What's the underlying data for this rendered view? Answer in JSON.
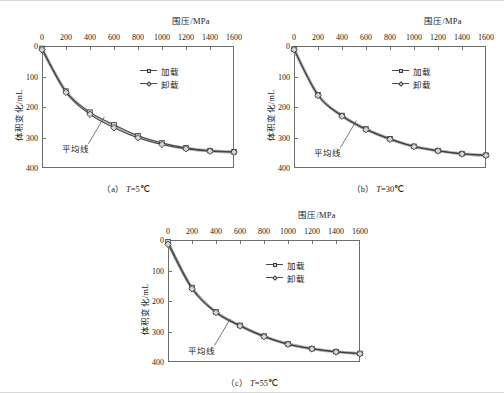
{
  "figure": {
    "panels": [
      {
        "id": "a",
        "caption_prefix": "（a）",
        "caption_var": "T",
        "caption_value": "=5℃",
        "x_axis_title": "围压/MPa",
        "y_axis_title": "体积变化/mL",
        "annotation": "平均线",
        "legend": [
          {
            "label": "加载",
            "marker": "square-marker"
          },
          {
            "label": "卸载",
            "marker": "diamond-marker"
          }
        ]
      },
      {
        "id": "b",
        "caption_prefix": "（b）",
        "caption_var": "T",
        "caption_value": "=30℃",
        "x_axis_title": "围压/MPa",
        "y_axis_title": "体积变化/mL",
        "annotation": "平均线",
        "legend": [
          {
            "label": "加载",
            "marker": "square-marker"
          },
          {
            "label": "卸载",
            "marker": "diamond-marker"
          }
        ]
      },
      {
        "id": "c",
        "caption_prefix": "（c）",
        "caption_var": "T",
        "caption_value": "=55℃",
        "x_axis_title": "围压/MPa",
        "y_axis_title": "体积变化/mL",
        "annotation": "平均线",
        "legend": [
          {
            "label": "加载",
            "marker": "square-marker"
          },
          {
            "label": "卸载",
            "marker": "diamond-marker"
          }
        ]
      }
    ]
  },
  "chart_data": [
    {
      "type": "line",
      "title": "（a）T=5℃",
      "xlabel": "围压/MPa",
      "ylabel": "体积变化/mL",
      "xlim": [
        0,
        1600
      ],
      "ylim": [
        0,
        400
      ],
      "y_inverted": true,
      "grid": false,
      "legend_position": "upper-right-inside",
      "xticks": [
        0,
        200,
        400,
        600,
        800,
        1000,
        1200,
        1400,
        1600
      ],
      "yticks": [
        0,
        100,
        200,
        300,
        400
      ],
      "annotations": [
        {
          "text": "平均线",
          "points_to_x": 520,
          "points_to_y": 232
        }
      ],
      "x": [
        0,
        200,
        400,
        600,
        800,
        1000,
        1200,
        1400,
        1600
      ],
      "series": [
        {
          "name": "加载",
          "marker": "square",
          "values": [
            8,
            148,
            217,
            258,
            294,
            318,
            334,
            343,
            347
          ]
        },
        {
          "name": "卸载",
          "marker": "diamond",
          "values": [
            12,
            152,
            224,
            268,
            301,
            323,
            337,
            345,
            348
          ]
        }
      ]
    },
    {
      "type": "line",
      "title": "（b）T=30℃",
      "xlabel": "围压/MPa",
      "ylabel": "体积变化/mL",
      "xlim": [
        0,
        1600
      ],
      "ylim": [
        0,
        400
      ],
      "y_inverted": true,
      "grid": false,
      "legend_position": "upper-right-inside",
      "xticks": [
        0,
        200,
        400,
        600,
        800,
        1000,
        1200,
        1400,
        1600
      ],
      "yticks": [
        0,
        100,
        200,
        300,
        400
      ],
      "annotations": [
        {
          "text": "平均线",
          "points_to_x": 520,
          "points_to_y": 245
        }
      ],
      "x": [
        0,
        200,
        400,
        600,
        800,
        1000,
        1200,
        1400,
        1600
      ],
      "series": [
        {
          "name": "加载",
          "marker": "square",
          "values": [
            10,
            160,
            228,
            272,
            304,
            329,
            343,
            353,
            358
          ]
        },
        {
          "name": "卸载",
          "marker": "diamond",
          "values": [
            12,
            162,
            230,
            274,
            306,
            330,
            344,
            354,
            359
          ]
        }
      ]
    },
    {
      "type": "line",
      "title": "（c）T=55℃",
      "xlabel": "围压/MPa",
      "ylabel": "体积变化/mL",
      "xlim": [
        0,
        1600
      ],
      "ylim": [
        0,
        400
      ],
      "y_inverted": true,
      "grid": false,
      "legend_position": "upper-right-inside",
      "xticks": [
        0,
        200,
        400,
        600,
        800,
        1000,
        1200,
        1400,
        1600
      ],
      "yticks": [
        0,
        100,
        200,
        300,
        400
      ],
      "annotations": [
        {
          "text": "平均线",
          "points_to_x": 520,
          "points_to_y": 258
        }
      ],
      "x": [
        0,
        200,
        400,
        600,
        800,
        1000,
        1200,
        1400,
        1600
      ],
      "series": [
        {
          "name": "加载",
          "marker": "square",
          "values": [
            6,
            156,
            236,
            280,
            315,
            341,
            356,
            366,
            372
          ]
        },
        {
          "name": "卸载",
          "marker": "diamond",
          "values": [
            14,
            160,
            238,
            282,
            317,
            342,
            357,
            367,
            373
          ]
        }
      ]
    }
  ]
}
